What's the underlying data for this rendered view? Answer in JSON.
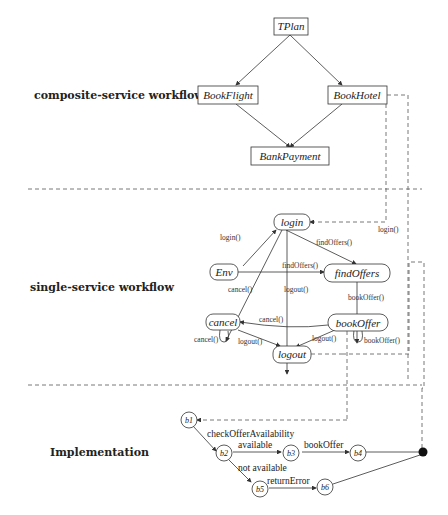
{
  "sections": {
    "composite": "composite-service workflow",
    "single": "single-service workflow",
    "implementation": "Implementation"
  },
  "composite_nodes": {
    "tplan": "TPlan",
    "bookflight": "BookFlight",
    "bookhotel": "BookHotel",
    "bankpayment": "BankPayment"
  },
  "single_nodes": {
    "login": "login",
    "env": "Env",
    "findoffers": "findOffers",
    "cancel": "cancel",
    "bookoffer": "bookOffer",
    "logout": "logout"
  },
  "single_edges": {
    "env_login": "login()",
    "login_find": "findOffers()",
    "env_find": "findOffers()",
    "env_cancel": "cancel()",
    "login_logout": "logout()",
    "find_book": "bookOffer()",
    "book_cancel": "cancel()",
    "cancel_self": "cancel()",
    "cancel_logout": "logout()",
    "book_logout": "logout()",
    "book_self": "bookOffer()",
    "bookhotel_login": "login()"
  },
  "impl_nodes": {
    "b1": "b1",
    "b2": "b2",
    "b3": "b3",
    "b4": "b4",
    "b5": "b5",
    "b6": "b6"
  },
  "impl_edges": {
    "b1_b2": "checkOfferAvailability",
    "b2_b3": "available",
    "b3_b4": "bookOffer",
    "b2_b5": "not available",
    "b5_b6": "returnError"
  }
}
